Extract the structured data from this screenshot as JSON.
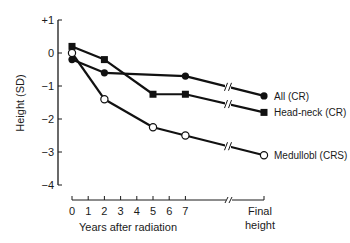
{
  "chart_data": {
    "type": "line",
    "title": "",
    "xlabel": "Years after radiation",
    "ylabel": "Height (SD)",
    "ylim": [
      -4,
      1
    ],
    "yticks": [
      1,
      0,
      -1,
      -2,
      -3,
      -4
    ],
    "ytick_labels": [
      "+1",
      "0",
      "−1",
      "−2",
      "−3",
      "−4"
    ],
    "x_ticks": [
      0,
      1,
      2,
      3,
      4,
      5,
      6,
      7,
      "Final height"
    ],
    "x_tick_labels": [
      "0",
      "1",
      "2",
      "3",
      "4",
      "5",
      "6",
      "7"
    ],
    "final_label_line1": "Final",
    "final_label_line2": "height",
    "axis_break": true,
    "grid": false,
    "legend_position": "inline-right",
    "series": [
      {
        "name": "All (CR)",
        "marker": "filled-circle",
        "x": [
          0,
          2,
          7,
          "Final height"
        ],
        "values": [
          -0.2,
          -0.6,
          -0.7,
          -1.3
        ]
      },
      {
        "name": "Head-neck (CR)",
        "marker": "filled-square",
        "x": [
          0,
          2,
          5,
          7,
          "Final height"
        ],
        "values": [
          0.2,
          -0.2,
          -1.25,
          -1.25,
          -1.8
        ]
      },
      {
        "name": "Medullobl (CRS)",
        "marker": "open-circle",
        "x": [
          0,
          2,
          5,
          7,
          "Final height"
        ],
        "values": [
          0.0,
          -1.4,
          -2.25,
          -2.5,
          -3.1
        ]
      }
    ]
  }
}
